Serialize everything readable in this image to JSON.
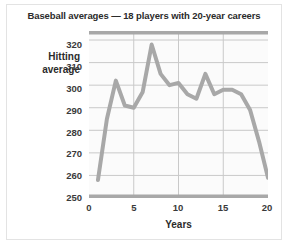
{
  "chart_data": {
    "type": "line",
    "title": "Baseball averages — 18 players with 20-year careers",
    "xlabel": "Years",
    "ylabel": "Hitting average",
    "ylabel_line1": "Hitting",
    "ylabel_line2": "average",
    "xlim": [
      0,
      20
    ],
    "ylim": [
      250,
      324
    ],
    "xticks": [
      0,
      5,
      10,
      15,
      20
    ],
    "yticks": [
      250,
      260,
      270,
      280,
      290,
      300,
      310,
      320
    ],
    "xtick_labels": [
      "0",
      "5",
      "10",
      "15",
      "20"
    ],
    "ytick_labels": [
      "250",
      "260",
      "270",
      "280",
      "290",
      "300",
      "310",
      "320"
    ],
    "grid": true,
    "grid_axis": "both",
    "legend": "none",
    "line_color": "#a8a8a8",
    "line_width": 4,
    "plot_background": "#fbfbfb",
    "grid_color": "#c9c9c9",
    "axis_color": "#a8a8a8",
    "x": [
      1,
      2,
      3,
      4,
      5,
      6,
      7,
      8,
      9,
      10,
      11,
      12,
      13,
      14,
      15,
      16,
      17,
      18,
      19,
      20
    ],
    "series": [
      {
        "name": "Hitting average",
        "values": [
          258,
          285,
          302,
          291,
          290,
          297,
          318,
          305,
          300,
          301,
          296,
          294,
          305,
          296,
          298,
          298,
          296,
          289,
          275,
          259
        ]
      }
    ]
  },
  "ytick_positions": [
    {
      "label": "250",
      "top": 192
    },
    {
      "label": "260",
      "top": 170
    },
    {
      "label": "270",
      "top": 148
    },
    {
      "label": "280",
      "top": 127
    },
    {
      "label": "290",
      "top": 105
    },
    {
      "label": "300",
      "top": 83
    },
    {
      "label": "310",
      "top": 61
    },
    {
      "label": "320",
      "top": 39
    }
  ],
  "xtick_positions": [
    {
      "label": "0",
      "left": 77
    },
    {
      "label": "5",
      "left": 122
    },
    {
      "label": "10",
      "left": 166
    },
    {
      "label": "15",
      "left": 211
    },
    {
      "label": "20",
      "left": 255
    }
  ]
}
